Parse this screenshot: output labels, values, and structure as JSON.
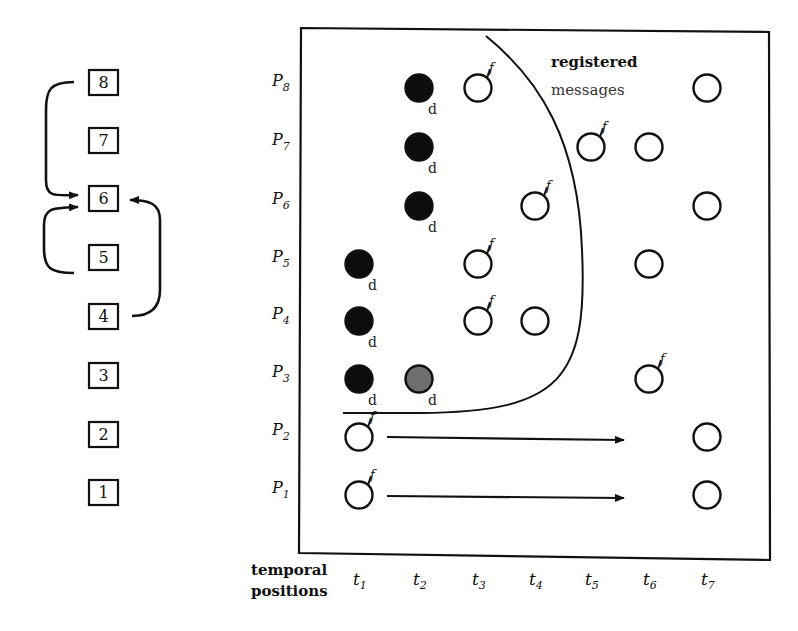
{
  "stack": {
    "boxes": [
      "1",
      "2",
      "3",
      "4",
      "5",
      "6",
      "7",
      "8"
    ],
    "arrows": [
      {
        "from": "8",
        "to": "6",
        "side": "left"
      },
      {
        "from": "5",
        "to": "6",
        "side": "left"
      },
      {
        "from": "4",
        "to": "6",
        "side": "right"
      }
    ]
  },
  "grid": {
    "rows": [
      {
        "name": "P",
        "sub": "8"
      },
      {
        "name": "P",
        "sub": "7"
      },
      {
        "name": "P",
        "sub": "6"
      },
      {
        "name": "P",
        "sub": "5"
      },
      {
        "name": "P",
        "sub": "4"
      },
      {
        "name": "P",
        "sub": "3"
      },
      {
        "name": "P",
        "sub": "2"
      },
      {
        "name": "P",
        "sub": "1"
      }
    ],
    "columns": [
      {
        "name": "t",
        "sub": "1"
      },
      {
        "name": "t",
        "sub": "2"
      },
      {
        "name": "t",
        "sub": "3"
      },
      {
        "name": "t",
        "sub": "4"
      },
      {
        "name": "t",
        "sub": "5"
      },
      {
        "name": "t",
        "sub": "6"
      },
      {
        "name": "t",
        "sub": "7"
      }
    ],
    "axis_label_line1": "temporal",
    "axis_label_line2": "positions",
    "region_label_line1": "registered",
    "region_label_line2": "messages",
    "mark_d": "d",
    "mark_f": "f"
  },
  "chart_data": {
    "type": "diagram",
    "nodes": [
      {
        "row": "P8",
        "col": "t2",
        "style": "filled",
        "mark": "d"
      },
      {
        "row": "P8",
        "col": "t3",
        "style": "open",
        "mark": "f"
      },
      {
        "row": "P8",
        "col": "t7",
        "style": "open",
        "mark": ""
      },
      {
        "row": "P7",
        "col": "t2",
        "style": "filled",
        "mark": "d"
      },
      {
        "row": "P7",
        "col": "t5",
        "style": "open",
        "mark": "f"
      },
      {
        "row": "P7",
        "col": "t6",
        "style": "open",
        "mark": ""
      },
      {
        "row": "P6",
        "col": "t2",
        "style": "filled",
        "mark": "d"
      },
      {
        "row": "P6",
        "col": "t4",
        "style": "open",
        "mark": "f"
      },
      {
        "row": "P6",
        "col": "t7",
        "style": "open",
        "mark": ""
      },
      {
        "row": "P5",
        "col": "t1",
        "style": "filled",
        "mark": "d"
      },
      {
        "row": "P5",
        "col": "t3",
        "style": "open",
        "mark": "f"
      },
      {
        "row": "P5",
        "col": "t6",
        "style": "open",
        "mark": ""
      },
      {
        "row": "P4",
        "col": "t1",
        "style": "filled",
        "mark": "d"
      },
      {
        "row": "P4",
        "col": "t3",
        "style": "open",
        "mark": "f"
      },
      {
        "row": "P4",
        "col": "t4",
        "style": "open",
        "mark": ""
      },
      {
        "row": "P3",
        "col": "t1",
        "style": "filled",
        "mark": "d"
      },
      {
        "row": "P3",
        "col": "t2",
        "style": "gray",
        "mark": "d"
      },
      {
        "row": "P3",
        "col": "t6",
        "style": "open",
        "mark": "f"
      },
      {
        "row": "P2",
        "col": "t1",
        "style": "open",
        "mark": "f"
      },
      {
        "row": "P2",
        "col": "t7",
        "style": "open",
        "mark": ""
      },
      {
        "row": "P1",
        "col": "t1",
        "style": "open",
        "mark": "f"
      },
      {
        "row": "P1",
        "col": "t7",
        "style": "open",
        "mark": ""
      }
    ],
    "arrows": [
      {
        "row": "P2",
        "from": "t1",
        "to": "t6"
      },
      {
        "row": "P1",
        "from": "t1",
        "to": "t6"
      }
    ],
    "region": "registered messages (area right of curve)"
  }
}
